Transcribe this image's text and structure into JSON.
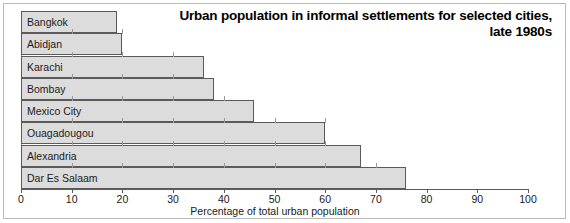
{
  "chart_data": {
    "type": "bar",
    "orientation": "horizontal",
    "title": "Urban population in informal settlements for selected cities, late 1980s",
    "title_lines": [
      "Urban population in informal settlements for selected cities,",
      "late 1980s"
    ],
    "xlabel": "Percentage of total urban population",
    "ylabel": "",
    "categories": [
      "Bangkok",
      "Abidjan",
      "Karachi",
      "Bombay",
      "Mexico City",
      "Ouagadougou",
      "Alexandria",
      "Dar Es Salaam"
    ],
    "values": [
      19,
      20,
      36,
      38,
      46,
      60,
      67,
      76
    ],
    "xlim": [
      0,
      100
    ],
    "xticks": [
      0,
      10,
      20,
      30,
      40,
      50,
      60,
      70,
      80,
      90,
      100
    ],
    "xtick_labels": [
      "0",
      "10",
      "20",
      "30",
      "40",
      "50",
      "60",
      "70",
      "80",
      "90",
      "100"
    ],
    "grid": false,
    "legend": null,
    "colors": {
      "bar_fill": "#dcdcdc",
      "bar_border": "#5a5a5a",
      "axis": "#5c5c5c",
      "text": "#1a1a1a",
      "frame": "#b9b9b9",
      "background": "#ffffff"
    }
  }
}
